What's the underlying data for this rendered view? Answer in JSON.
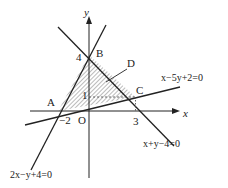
{
  "figure": {
    "axes": {
      "x_label": "x",
      "y_label": "y",
      "origin_label": "O",
      "x_ticks": [
        {
          "value": -2,
          "label": "−2"
        },
        {
          "value": 3,
          "label": "3"
        }
      ],
      "y_ticks": [
        {
          "value": 4,
          "label": "4"
        },
        {
          "value": 1,
          "label": "1"
        }
      ]
    },
    "points": {
      "A": {
        "label": "A",
        "coords": [
          -2,
          0
        ]
      },
      "B": {
        "label": "B",
        "coords": [
          0,
          4
        ]
      },
      "C": {
        "label": "C",
        "coords": [
          3,
          1
        ]
      },
      "D": {
        "label": "D"
      }
    },
    "lines": {
      "line1": {
        "equation": "2x−y+4=0"
      },
      "line2": {
        "equation": "x+y−4=0"
      },
      "line3": {
        "equation": "x−5y+2=0"
      }
    },
    "region": {
      "description": "shaded triangle ABC",
      "fill": "hatched"
    },
    "colors": {
      "stroke": "#222222",
      "background": "#ffffff"
    }
  }
}
